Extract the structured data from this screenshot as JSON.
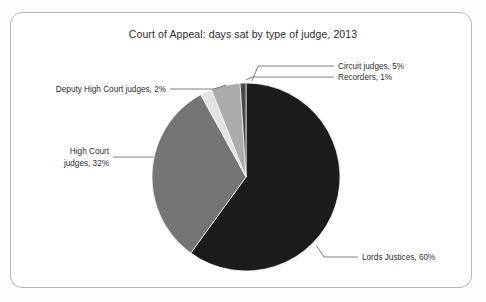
{
  "chart_data": {
    "type": "pie",
    "title": "Court of Appeal: days sat by type of judge, 2013",
    "xlabel": "",
    "ylabel": "",
    "unit": "%",
    "legend_position": "callout-labels",
    "grid": false,
    "categories": [
      "Lords Justices",
      "High Court judges",
      "Deputy High Court judges",
      "Circuit judges",
      "Recorders"
    ],
    "values": [
      60,
      32,
      2,
      5,
      1
    ],
    "labels": [
      "Lords Justices, 60%",
      "High Court judges, 32%",
      "Deputy High Court judges, 2%",
      "Circuit judges, 5%",
      "Recorders, 1%"
    ],
    "colors": [
      "#1c1c1c",
      "#757575",
      "#e2e2e2",
      "#ababab",
      "#4a4a4a"
    ],
    "slices": [
      {
        "name": "Lords Justices",
        "label": "Lords Justices, 60%",
        "value": 60,
        "color": "#1c1c1c",
        "start_deg": 0,
        "end_deg": 216
      },
      {
        "name": "High Court judges",
        "label_line1": "High Court",
        "label_line2": "judges, 32%",
        "label": "High Court judges, 32%",
        "value": 32,
        "color": "#757575",
        "start_deg": 216,
        "end_deg": 331.2
      },
      {
        "name": "Deputy High Court judges",
        "label": "Deputy High Court judges, 2%",
        "value": 2,
        "color": "#e2e2e2",
        "start_deg": 331.2,
        "end_deg": 338.4
      },
      {
        "name": "Circuit judges",
        "label": "Circuit judges, 5%",
        "value": 5,
        "color": "#ababab",
        "start_deg": 338.4,
        "end_deg": 356.4
      },
      {
        "name": "Recorders",
        "label": "Recorders, 1%",
        "value": 1,
        "color": "#4a4a4a",
        "start_deg": 356.4,
        "end_deg": 360
      }
    ]
  },
  "frame": {
    "border_color": "#b6b6b6",
    "background": "#ffffff"
  }
}
